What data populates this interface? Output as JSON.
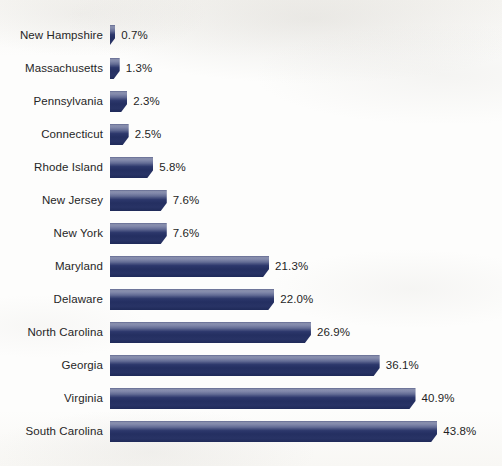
{
  "chart_data": {
    "type": "bar",
    "orientation": "horizontal",
    "title": "",
    "subtitle": "",
    "xlabel": "",
    "ylabel": "",
    "grid": false,
    "legend": null,
    "value_suffix": "%",
    "xlim": [
      0,
      43.8
    ],
    "axis_visible": false,
    "tick_labels": [],
    "categories": [
      "New Hampshire",
      "Massachusetts",
      "Pennsylvania",
      "Connecticut",
      "Rhode Island",
      "New Jersey",
      "New York",
      "Maryland",
      "Delaware",
      "North Carolina",
      "Georgia",
      "Virginia",
      "South Carolina"
    ],
    "values": [
      0.7,
      1.3,
      2.3,
      2.5,
      5.8,
      7.6,
      7.6,
      21.3,
      22.0,
      26.9,
      36.1,
      40.9,
      43.8
    ],
    "value_labels": [
      "0.7%",
      "1.3%",
      "2.3%",
      "2.5%",
      "5.8%",
      "7.6%",
      "7.6%",
      "21.3%",
      "22.0%",
      "26.9%",
      "36.1%",
      "40.9%",
      "43.8%"
    ],
    "bars": [
      {
        "category": "New Hampshire",
        "value": 0.7,
        "label": "0.7%"
      },
      {
        "category": "Massachusetts",
        "value": 1.3,
        "label": "1.3%"
      },
      {
        "category": "Pennsylvania",
        "value": 2.3,
        "label": "2.3%"
      },
      {
        "category": "Connecticut",
        "value": 2.5,
        "label": "2.5%"
      },
      {
        "category": "Rhode Island",
        "value": 5.8,
        "label": "5.8%"
      },
      {
        "category": "New Jersey",
        "value": 7.6,
        "label": "7.6%"
      },
      {
        "category": "New York",
        "value": 7.6,
        "label": "7.6%"
      },
      {
        "category": "Maryland",
        "value": 21.3,
        "label": "21.3%"
      },
      {
        "category": "Delaware",
        "value": 22.0,
        "label": "22.0%"
      },
      {
        "category": "North Carolina",
        "value": 26.9,
        "label": "26.9%"
      },
      {
        "category": "Georgia",
        "value": 36.1,
        "label": "36.1%"
      },
      {
        "category": "Virginia",
        "value": 40.9,
        "label": "40.9%"
      },
      {
        "category": "South Carolina",
        "value": 43.8,
        "label": "43.8%"
      }
    ],
    "colors": {
      "bar_top": "#6d7498",
      "bar_mid": "#2c376b",
      "bar_bottom": "#1f2a59",
      "background": "#fdfdfc",
      "label_text": "#262626",
      "value_text": "#1f1f1f"
    }
  },
  "layout": {
    "bar_origin_x": 110,
    "px_per_percent": 7.47,
    "bar_height": 21,
    "row_pitch": 33,
    "first_row_top": 25,
    "label_right_edge": 103,
    "value_gap": 6
  }
}
